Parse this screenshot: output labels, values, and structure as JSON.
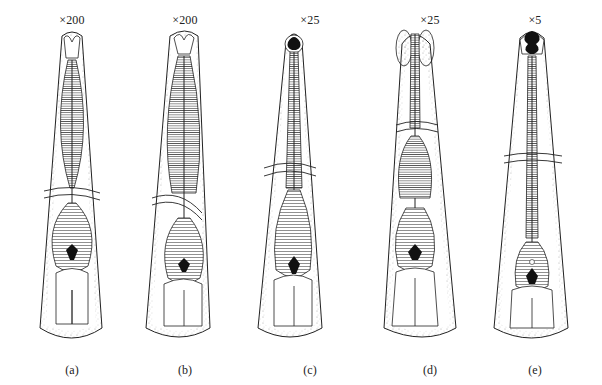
{
  "figure": {
    "background": "#ffffff",
    "line_color": "#222222",
    "stipple_color": "#9a9a9a",
    "panels": [
      {
        "magnification": "×200",
        "label": "(a)",
        "head": "bilobed-lips"
      },
      {
        "magnification": "×200",
        "label": "(b)",
        "head": "bilobed-lips"
      },
      {
        "magnification": "×25",
        "label": "(c)",
        "head": "dark-buccal-capsule"
      },
      {
        "magnification": "×25",
        "label": "(d)",
        "head": "inflated-cephalic-vesicle"
      },
      {
        "magnification": "×5",
        "label": "(e)",
        "head": "dark-buccal-capsule-lips"
      }
    ]
  }
}
